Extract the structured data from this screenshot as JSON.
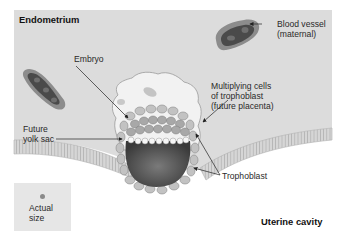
{
  "figure": {
    "regions": {
      "endometrium": "Endometrium",
      "uterine_cavity": "Uterine cavity"
    },
    "labels": {
      "embryo": "Embryo",
      "blood_vessel": "Blood vessel\n(maternal)",
      "trophoblast_cells": "Multiplying cells\nof trophoblast\n(future placenta)",
      "yolk_sac": "Future\nyolk sac",
      "trophoblast": "Trophoblast",
      "actual_size": "Actual\nsize"
    },
    "colors": {
      "endometrium_bg": "#dcdcdc",
      "cavity_bg": "#ffffff",
      "epithelium": "#cfcfcf",
      "vessel_outer": "#8c8c8c",
      "vessel_inner": "#4a4a4a",
      "yolk_sac": "#5a5a5a",
      "cells": "#b4b4b4",
      "text": "#2a2a2a"
    }
  }
}
